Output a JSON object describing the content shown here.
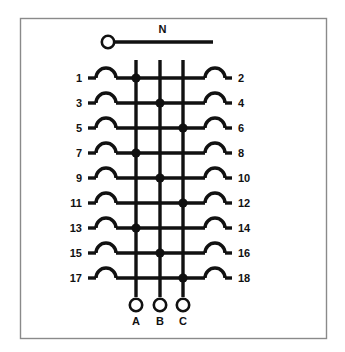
{
  "diagram": {
    "title": "N",
    "type": "electrical-busbar-wiring-diagram",
    "neutral": {
      "label": "N",
      "terminal_icon": "circle-terminal-icon"
    },
    "phase_buses": [
      {
        "id": "A",
        "label": "A",
        "terminal_icon": "circle-terminal-icon"
      },
      {
        "id": "B",
        "label": "B",
        "terminal_icon": "circle-terminal-icon"
      },
      {
        "id": "C",
        "label": "C",
        "terminal_icon": "circle-terminal-icon"
      }
    ],
    "rows": [
      {
        "left_label": "1",
        "right_label": "2",
        "connected_bus": "A"
      },
      {
        "left_label": "3",
        "right_label": "4",
        "connected_bus": "B"
      },
      {
        "left_label": "5",
        "right_label": "6",
        "connected_bus": "C"
      },
      {
        "left_label": "7",
        "right_label": "8",
        "connected_bus": "A"
      },
      {
        "left_label": "9",
        "right_label": "10",
        "connected_bus": "B"
      },
      {
        "left_label": "11",
        "right_label": "12",
        "connected_bus": "C"
      },
      {
        "left_label": "13",
        "right_label": "14",
        "connected_bus": "A"
      },
      {
        "left_label": "15",
        "right_label": "16",
        "connected_bus": "B"
      },
      {
        "left_label": "17",
        "right_label": "18",
        "connected_bus": "C"
      }
    ],
    "colors": {
      "wire": "#111111",
      "frame": "#8a8a8a",
      "background": "#ffffff"
    }
  }
}
